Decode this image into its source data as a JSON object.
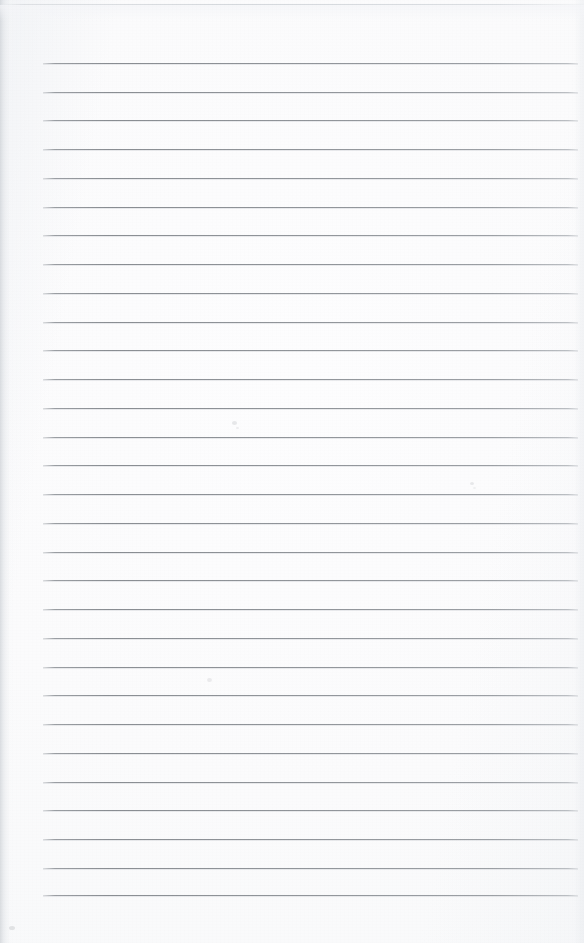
{
  "document": {
    "kind": "lined-notebook-paper-scan",
    "description": "Blank sheet of ruled notebook paper, scanned",
    "written_text": "",
    "page_width": 584,
    "page_height": 943,
    "paper_color": "#fbfbfc",
    "background_color": "#ffffff"
  },
  "ruling": {
    "line_color": "#92969b",
    "line_thickness": 1,
    "line_count": 30,
    "first_line_y": 63,
    "last_line_y": 895,
    "line_spacing": 28.69,
    "line_start_x": 43,
    "line_end_x": 578,
    "line_length": 535,
    "margin_rule": "none",
    "y_positions": [
      63,
      92,
      120,
      149,
      178,
      207,
      235,
      264,
      293,
      322,
      350,
      379,
      408,
      437,
      465,
      494,
      523,
      552,
      580,
      609,
      638,
      667,
      695,
      724,
      753,
      782,
      810,
      839,
      868,
      895
    ]
  },
  "page_edges": {
    "top_edge_line_y": 4,
    "top_edge_color": "#ced2d7",
    "left_shadow_width": 14,
    "left_shadow_color": "#cdd1d6",
    "right_shadow_width": 10,
    "right_shadow_color": "#e4e7eb"
  },
  "artifacts": {
    "label": "scanner dust specks",
    "specks": [
      {
        "x": 232,
        "y": 421,
        "size": 5,
        "opacity": 0.16
      },
      {
        "x": 236,
        "y": 427,
        "size": 3,
        "opacity": 0.12
      },
      {
        "x": 470,
        "y": 482,
        "size": 4,
        "opacity": 0.15
      },
      {
        "x": 473,
        "y": 487,
        "size": 3,
        "opacity": 0.1
      },
      {
        "x": 207,
        "y": 678,
        "size": 5,
        "opacity": 0.13
      },
      {
        "x": 9,
        "y": 926,
        "size": 6,
        "opacity": 0.18
      },
      {
        "x": 606,
        "y": 0,
        "size": 0,
        "opacity": 0
      }
    ]
  }
}
